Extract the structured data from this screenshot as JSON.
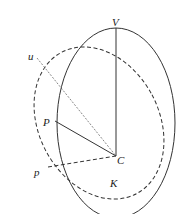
{
  "diagram": {
    "type": "geometric-construction",
    "colors": {
      "stroke": "#333333",
      "background": "#ffffff"
    },
    "labels": {
      "V": "V",
      "u": "u",
      "P": "P",
      "p": "p",
      "C": "C",
      "K": "K"
    },
    "shapes": [
      {
        "name": "solid-ellipse",
        "style": "solid"
      },
      {
        "name": "dashed-ellipse",
        "style": "dashed"
      }
    ],
    "lines": [
      {
        "from": "V",
        "to": "C",
        "style": "solid"
      },
      {
        "from": "u",
        "to": "C",
        "style": "dashed-thin"
      },
      {
        "from": "P",
        "to": "C",
        "style": "solid"
      },
      {
        "from": "p",
        "to": "C",
        "style": "dashed"
      }
    ]
  }
}
